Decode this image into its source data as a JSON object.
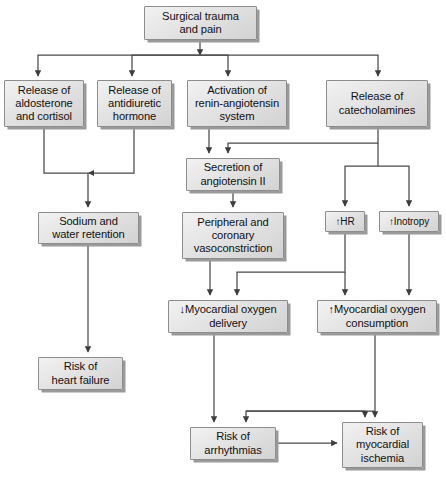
{
  "diagram": {
    "type": "flowchart",
    "canvas": {
      "width": 446,
      "height": 486
    },
    "style": {
      "box_fill_light": "#f2f2f2",
      "box_fill_dark": "#d2d2d2",
      "box_border": "#8d8d8d",
      "box_shadow": "#9a9a9a",
      "edge_color": "#4a4a4a",
      "text_color": "#111111",
      "background": "#ffffff"
    },
    "nodes": [
      {
        "id": "surgical_trauma",
        "label": "Surgical trauma\nand pain",
        "x": 144,
        "y": 6,
        "w": 113,
        "h": 34
      },
      {
        "id": "aldosterone",
        "label": "Release of\naldosterone\nand cortisol",
        "x": 4,
        "y": 80,
        "w": 80,
        "h": 47
      },
      {
        "id": "adh",
        "label": "Release of\nantidiuretic\nhormone",
        "x": 97,
        "y": 80,
        "w": 75,
        "h": 47
      },
      {
        "id": "raas",
        "label": "Activation of\nrenin-angiotensin\nsystem",
        "x": 187,
        "y": 80,
        "w": 100,
        "h": 47
      },
      {
        "id": "catecholamines",
        "label": "Release of\ncatecholamines",
        "x": 326,
        "y": 80,
        "w": 102,
        "h": 47
      },
      {
        "id": "angiotensin",
        "label": "Secretion of\nangiotensin II",
        "x": 186,
        "y": 158,
        "w": 94,
        "h": 33
      },
      {
        "id": "sodium_water",
        "label": "Sodium and\nwater retention",
        "x": 38,
        "y": 212,
        "w": 101,
        "h": 32
      },
      {
        "id": "vasoconstriction",
        "label": "Peripheral and\ncoronary\nvasoconstriction",
        "x": 182,
        "y": 212,
        "w": 102,
        "h": 47
      },
      {
        "id": "hr",
        "label": "↑HR",
        "x": 325,
        "y": 211,
        "w": 40,
        "h": 21
      },
      {
        "id": "inotropy",
        "label": "↑Inotropy",
        "x": 379,
        "y": 211,
        "w": 60,
        "h": 21
      },
      {
        "id": "mo2_delivery",
        "label": "↓Myocardial oxygen\ndelivery",
        "x": 168,
        "y": 300,
        "w": 120,
        "h": 33
      },
      {
        "id": "mo2_consumption",
        "label": "↑Myocardial oxygen\nconsumption",
        "x": 317,
        "y": 300,
        "w": 120,
        "h": 33
      },
      {
        "id": "heart_failure",
        "label": "Risk of\nheart failure",
        "x": 38,
        "y": 357,
        "w": 85,
        "h": 33
      },
      {
        "id": "arrhythmias",
        "label": "Risk of\narrhythmias",
        "x": 190,
        "y": 427,
        "w": 86,
        "h": 33
      },
      {
        "id": "myocardial_ischemia",
        "label": "Risk of\nmyocardial\nischemia",
        "x": 342,
        "y": 422,
        "w": 81,
        "h": 46
      }
    ],
    "edges": [
      {
        "from": "surgical_trauma",
        "to": "aldosterone"
      },
      {
        "from": "surgical_trauma",
        "to": "adh"
      },
      {
        "from": "surgical_trauma",
        "to": "raas"
      },
      {
        "from": "surgical_trauma",
        "to": "catecholamines"
      },
      {
        "from": "raas",
        "to": "angiotensin"
      },
      {
        "from": "catecholamines",
        "to": "angiotensin"
      },
      {
        "from": "aldosterone",
        "to": "sodium_water"
      },
      {
        "from": "adh",
        "to": "sodium_water"
      },
      {
        "from": "angiotensin",
        "to": "vasoconstriction"
      },
      {
        "from": "catecholamines",
        "to": "hr"
      },
      {
        "from": "catecholamines",
        "to": "inotropy"
      },
      {
        "from": "sodium_water",
        "to": "heart_failure"
      },
      {
        "from": "vasoconstriction",
        "to": "mo2_delivery"
      },
      {
        "from": "hr",
        "to": "mo2_delivery"
      },
      {
        "from": "hr",
        "to": "mo2_consumption"
      },
      {
        "from": "inotropy",
        "to": "mo2_consumption"
      },
      {
        "from": "mo2_delivery",
        "to": "arrhythmias"
      },
      {
        "from": "mo2_delivery",
        "to": "myocardial_ischemia"
      },
      {
        "from": "mo2_consumption",
        "to": "arrhythmias"
      },
      {
        "from": "mo2_consumption",
        "to": "myocardial_ischemia"
      },
      {
        "from": "arrhythmias",
        "to": "myocardial_ischemia"
      }
    ]
  }
}
